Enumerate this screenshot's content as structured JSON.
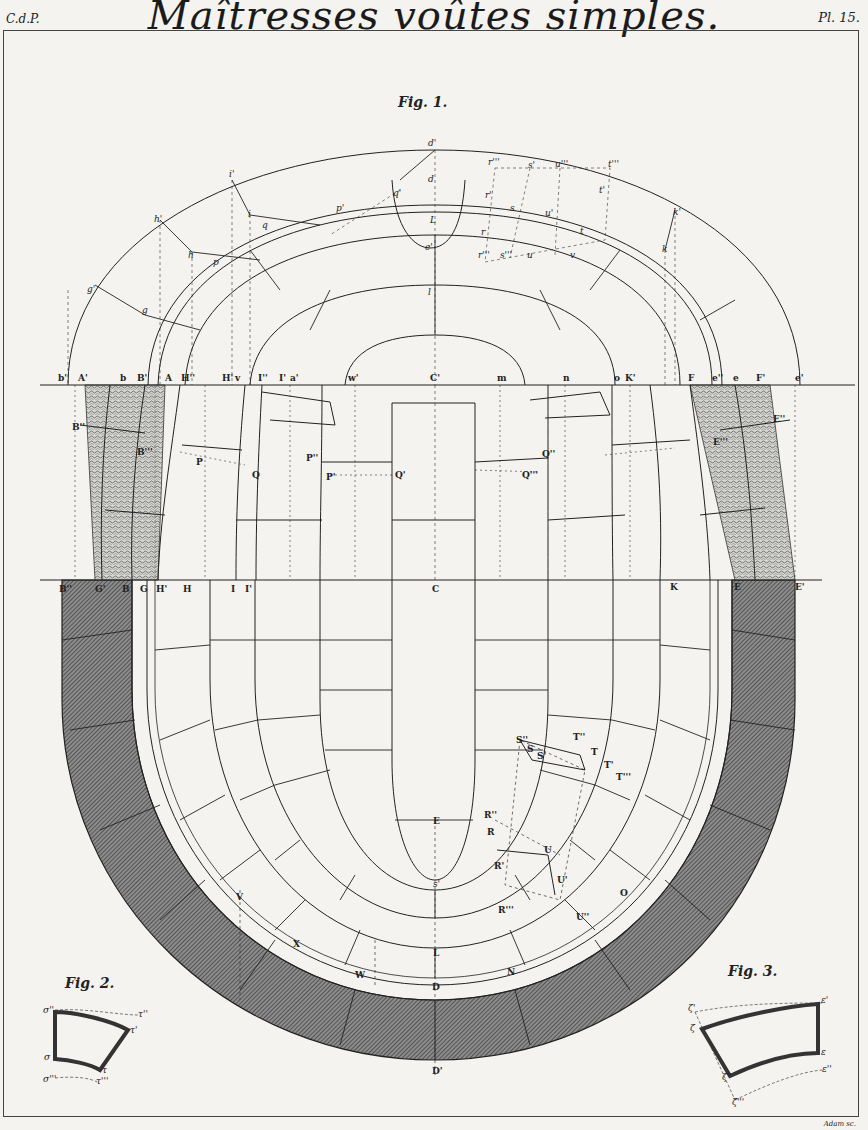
{
  "plate": {
    "title": "Maîtresses voûtes simples.",
    "left_mark": "C.d.P.",
    "right_mark": "Pl. 15.",
    "engraver_credit": "Adam sc."
  },
  "figures": {
    "fig1": {
      "caption": "Fig. 1."
    },
    "fig2": {
      "caption": "Fig. 2."
    },
    "fig3": {
      "caption": "Fig. 3."
    }
  },
  "labels": {
    "upper_plan": [
      "d'",
      "d",
      "q'",
      "L",
      "e'",
      "i'",
      "i",
      "q",
      "h'",
      "h",
      "p",
      "p'",
      "g'",
      "g",
      "l",
      "k'",
      "k",
      "r'''",
      "s'",
      "u'''",
      "t'''",
      "r'",
      "s",
      "u'",
      "t'",
      "t",
      "r",
      "r'''",
      "s'''",
      "u",
      "v"
    ],
    "upper_baseline": [
      "b'",
      "A'",
      "b",
      "B'",
      "A",
      "H''",
      "H'",
      "v",
      "I''",
      "I'",
      "a'",
      "w'",
      "C'",
      "m",
      "n",
      "o",
      "K'",
      "F",
      "e''",
      "e",
      "F'",
      "e'"
    ],
    "middle_band": [
      "B''",
      "B'''",
      "P",
      "Q",
      "P''",
      "P'",
      "Q'",
      "Q''",
      "Q'''",
      "E'''",
      "E''"
    ],
    "lower_baseline": [
      "B''",
      "G'",
      "B",
      "G",
      "H'",
      "H",
      "I",
      "I'",
      "C",
      "K",
      "E",
      "E'"
    ],
    "lower_plan": [
      "S''",
      "S",
      "S'",
      "T''",
      "T",
      "T'",
      "T'''",
      "R''",
      "R",
      "R'",
      "U",
      "U'",
      "R'''",
      "U''",
      "E",
      "s'",
      "L",
      "D",
      "D'",
      "V",
      "X",
      "W",
      "N",
      "O"
    ],
    "fig2": [
      "σ''",
      "σ",
      "σ'",
      "σ'''",
      "τ''",
      "τ'",
      "τ",
      "τ'''"
    ],
    "fig3": [
      "ζ'",
      "ζ",
      "ζ''",
      "ζ'''",
      "ε'",
      "ε",
      "ε''",
      "ε'''"
    ]
  },
  "colors": {
    "paper": "#f4f3ef",
    "ink": "#222222",
    "hatch_dark": "#555555",
    "stipple": "#8a8a8a"
  }
}
